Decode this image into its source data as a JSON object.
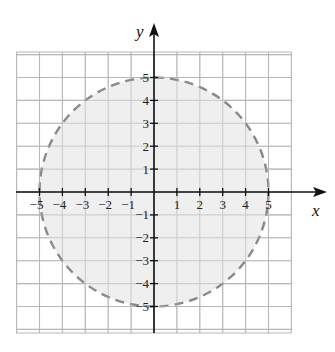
{
  "chart_data": {
    "type": "region",
    "title": "",
    "xlabel": "x",
    "ylabel": "y",
    "xlim": [
      -6,
      6
    ],
    "ylim": [
      -6,
      6
    ],
    "grid": true,
    "x_ticks": [
      -5,
      -4,
      -3,
      -2,
      -1,
      1,
      2,
      3,
      4,
      5
    ],
    "y_ticks": [
      -5,
      -4,
      -3,
      -2,
      -1,
      1,
      2,
      3,
      4,
      5
    ],
    "x_tick_labels": [
      "−5",
      "−4",
      "−3",
      "−2",
      "−1",
      "1",
      "2",
      "3",
      "4",
      "5"
    ],
    "y_tick_labels": [
      "−5",
      "−4",
      "−3",
      "−2",
      "−1",
      "1",
      "2",
      "3",
      "4",
      "5"
    ],
    "shapes": [
      {
        "kind": "circle",
        "center": [
          0,
          0
        ],
        "radius": 5,
        "boundary": "dashed",
        "filled": true,
        "description": "Shaded interior of circle x^2 + y^2 < 5^2"
      }
    ],
    "colors": {
      "fill": "#ececec",
      "boundary": "#8a8a8a",
      "grid": "#b8b8b8",
      "axis": "#111111"
    }
  }
}
